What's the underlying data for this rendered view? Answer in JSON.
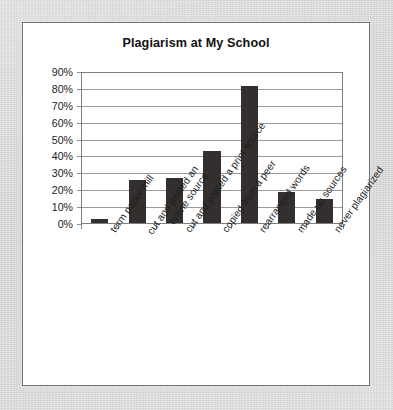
{
  "card": {
    "background_color": "#ffffff",
    "border_color": "#6f7375"
  },
  "page": {
    "background_color": "#d7d7d7"
  },
  "chart_data": {
    "type": "bar",
    "title": "Plagiarism at My School",
    "xlabel": "",
    "ylabel": "",
    "ylim": [
      0,
      90
    ],
    "ytick_labels": [
      "0%",
      "10%",
      "20%",
      "30%",
      "40%",
      "50%",
      "60%",
      "70%",
      "80%",
      "90%"
    ],
    "ytick_values": [
      0,
      10,
      20,
      30,
      40,
      50,
      60,
      70,
      80,
      90
    ],
    "grid": true,
    "legend": false,
    "bar_color": "#332f2e",
    "categories": [
      "term paper mill",
      "cut and pasted an online source",
      "cut and pasted a print source",
      "copied from a peer",
      "rearranged words",
      "made up sources",
      "never plagiarized"
    ],
    "category_lines": [
      [
        "term paper mill"
      ],
      [
        "cut and pasted an",
        "online source"
      ],
      [
        "cut and pasted a print source"
      ],
      [
        "copied from a peer"
      ],
      [
        "rearranged words"
      ],
      [
        "made up sources"
      ],
      [
        "never plagiarized"
      ]
    ],
    "values": [
      3,
      26,
      27,
      43,
      82,
      19,
      15
    ]
  }
}
